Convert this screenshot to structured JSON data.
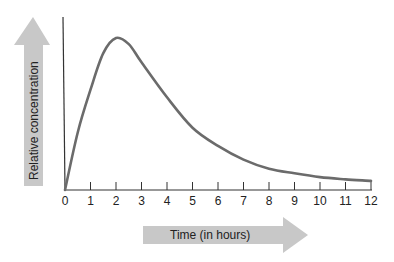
{
  "chart_data": {
    "type": "line",
    "title": "",
    "xlabel": "Time (in hours)",
    "ylabel": "Relative concentration",
    "x": [
      0,
      0.5,
      1,
      1.5,
      2,
      2.5,
      3,
      4,
      5,
      6,
      7,
      8,
      9,
      10,
      11,
      12
    ],
    "series": [
      {
        "name": "Relative concentration",
        "values": [
          0,
          0.38,
          0.66,
          0.9,
          1.0,
          0.96,
          0.84,
          0.61,
          0.41,
          0.29,
          0.2,
          0.14,
          0.11,
          0.085,
          0.07,
          0.06
        ]
      }
    ],
    "xticks": [
      "0",
      "1",
      "2",
      "3",
      "4",
      "5",
      "6",
      "7",
      "8",
      "9",
      "10",
      "11",
      "12"
    ],
    "xlim": [
      0,
      12
    ],
    "ylim": [
      0,
      1.13
    ],
    "yticks": [],
    "grid": false,
    "legend": "none",
    "colors": {
      "curve": "#6b6b6b",
      "axis": "#333333",
      "arrow": "#c8c8c8"
    }
  }
}
